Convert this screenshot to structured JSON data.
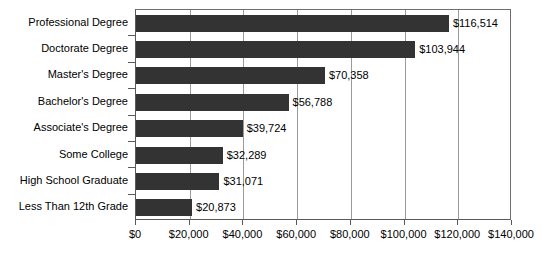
{
  "chart_data": {
    "type": "bar",
    "orientation": "horizontal",
    "title": "",
    "xlabel": "",
    "ylabel": "",
    "xlim": [
      0,
      140000
    ],
    "xticks": [
      0,
      20000,
      40000,
      60000,
      80000,
      100000,
      120000,
      140000
    ],
    "xtick_labels": [
      "$0",
      "$20,000",
      "$40,000",
      "$60,000",
      "$80,000",
      "$100,000",
      "$120,000",
      "$140,000"
    ],
    "grid": true,
    "grid_axis": "x",
    "legend": false,
    "bar_color": "#333333",
    "categories": [
      "Professional Degree",
      "Doctorate Degree",
      "Master's Degree",
      "Bachelor's Degree",
      "Associate's Degree",
      "Some College",
      "High School Graduate",
      "Less Than 12th Grade"
    ],
    "values": [
      116514,
      103944,
      70358,
      56788,
      39724,
      32289,
      31071,
      20873
    ],
    "value_labels": [
      "$116,514",
      "$103,944",
      "$70,358",
      "$56,788",
      "$39,724",
      "$32,289",
      "$31,071",
      "$20,873"
    ]
  }
}
